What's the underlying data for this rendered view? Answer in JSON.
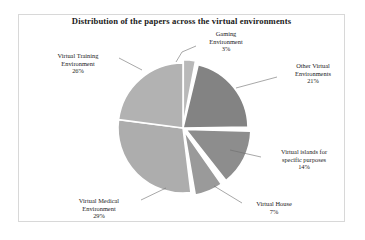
{
  "chart_data": {
    "type": "pie",
    "title": "Distribution of the papers across the virtual environments",
    "xlabel": "",
    "ylabel": "",
    "legend_position": "none",
    "grid": false,
    "units": "percent",
    "total": 100,
    "categories": [
      "Gaming Environment",
      "Other Virtual Environments",
      "Virtual islands for specific purposes",
      "Virtual House",
      "Virtual Medical Environment",
      "Virtual Training Environment"
    ],
    "values": [
      3,
      21,
      14,
      7,
      29,
      26
    ],
    "slices": [
      {
        "name": "gaming-environment",
        "label_line1": "Gaming",
        "label_line2": "Environment",
        "value_label": "3%",
        "value": 3,
        "color": "#b9b9b9",
        "start_deg": 0,
        "end_deg": 10.8,
        "exploded": true
      },
      {
        "name": "other-virtual-environments",
        "label_line1": "Other Virtual",
        "label_line2": "Environments",
        "value_label": "21%",
        "value": 21,
        "color": "#838383",
        "start_deg": 13.5,
        "end_deg": 89.1,
        "exploded": false
      },
      {
        "name": "virtual-islands-specific-purposes",
        "label_line1": "Virtual islands for",
        "label_line2": "specific purposes",
        "value_label": "14%",
        "value": 14,
        "color": "#8d8d8d",
        "start_deg": 91.5,
        "end_deg": 141.9,
        "exploded": true
      },
      {
        "name": "virtual-house",
        "label_line1": "Virtual House",
        "label_line2": "",
        "value_label": "7%",
        "value": 7,
        "color": "#9a9a9a",
        "start_deg": 145.0,
        "end_deg": 170.2,
        "exploded": true
      },
      {
        "name": "virtual-medical-environment",
        "label_line1": "Virtual Medical",
        "label_line2": "Environment",
        "value_label": "29%",
        "value": 29,
        "color": "#adadad",
        "start_deg": 173.0,
        "end_deg": 277.4,
        "exploded": false
      },
      {
        "name": "virtual-training-environment",
        "label_line1": "Virtual Training",
        "label_line2": "Environment",
        "value_label": "26%",
        "value": 26,
        "color": "#b2b2b2",
        "start_deg": 277.4,
        "end_deg": 360.0,
        "exploded": false
      }
    ],
    "colors": {
      "background": "#ffffff",
      "frame_border": "#d8d8d8",
      "separator": "#ffffff",
      "leader_line": "#6d6d6d",
      "text": "#1b1b1b"
    }
  }
}
